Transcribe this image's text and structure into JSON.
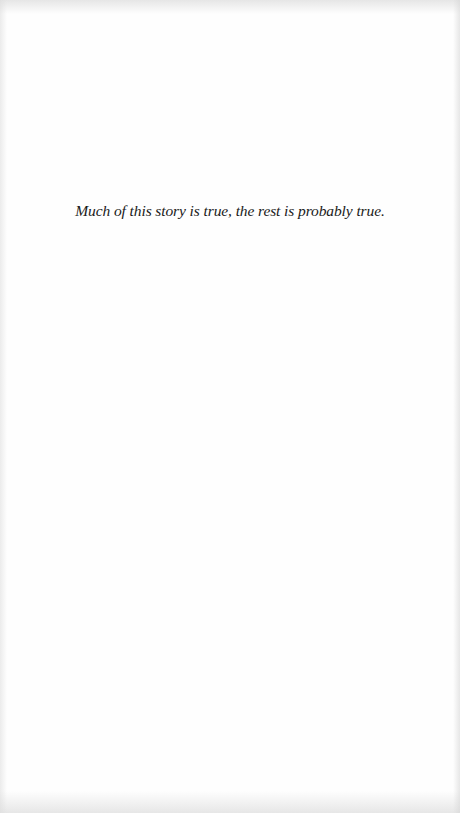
{
  "page": {
    "type": "epigraph",
    "epigraph_text": "Much of this story is true, the rest is probably true."
  },
  "colors": {
    "background": "#fefefe",
    "text": "#1a1a1a"
  }
}
